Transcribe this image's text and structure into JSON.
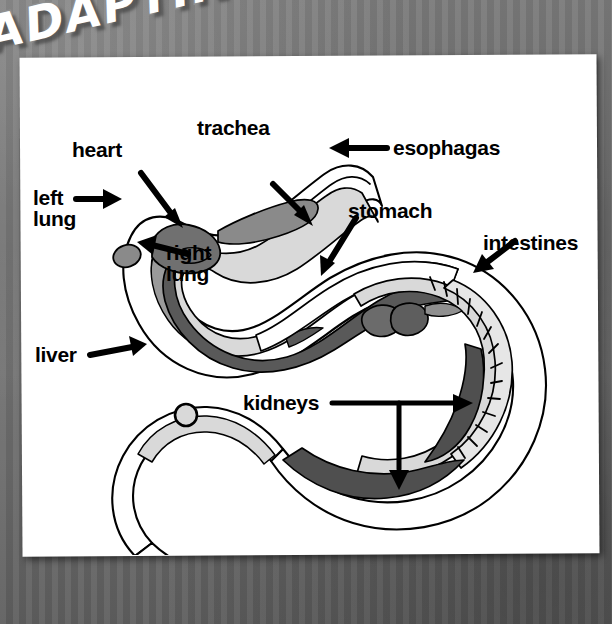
{
  "poster": {
    "title": "ADAPTING TO FIT",
    "background_color": "#6e6e6e",
    "page_color": "#ffffff"
  },
  "diagram": {
    "palette": {
      "outline": "#000000",
      "body_fill": "#ffffff",
      "lung_light_gray": "#d9d9d9",
      "organ_mid_gray": "#9a9a9a",
      "liver_dark_gray": "#595959",
      "kidney_dark_gray": "#4f4f4f"
    },
    "labels": [
      {
        "id": "heart",
        "text": "heart"
      },
      {
        "id": "trachea",
        "text": "trachea"
      },
      {
        "id": "esophagas",
        "text": "esophagas"
      },
      {
        "id": "left-lung",
        "text": "left\nlung"
      },
      {
        "id": "right-lung",
        "text": "right\nlung"
      },
      {
        "id": "stomach",
        "text": "stomach"
      },
      {
        "id": "intestines",
        "text": "intestines"
      },
      {
        "id": "liver",
        "text": "liver"
      },
      {
        "id": "kidneys",
        "text": "kidneys"
      }
    ]
  }
}
